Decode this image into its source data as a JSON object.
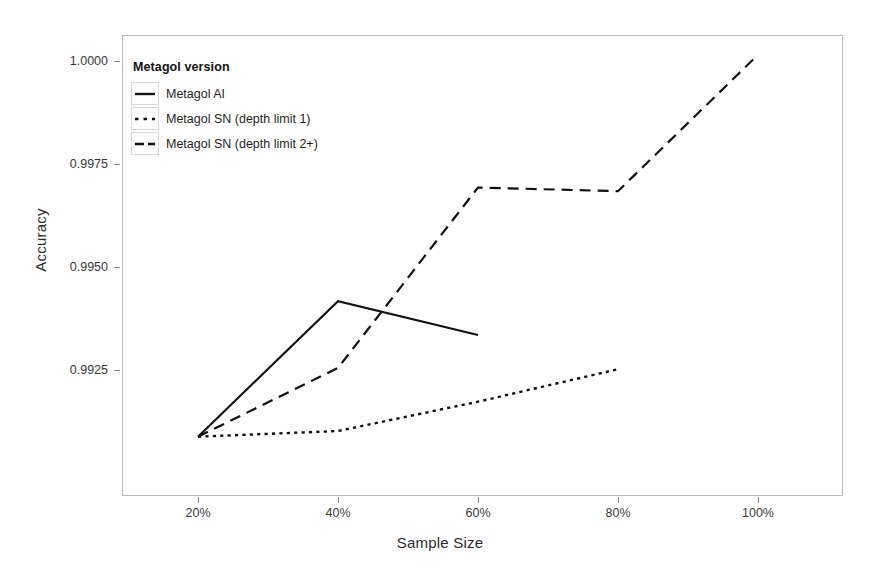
{
  "chart_data": {
    "type": "line",
    "title": "",
    "xlabel": "Sample Size",
    "ylabel": "Accuracy",
    "x": [
      "20%",
      "40%",
      "60%",
      "80%",
      "100%"
    ],
    "xtick_labels": [
      "20%",
      "40%",
      "60%",
      "80%",
      "100%"
    ],
    "ytick_labels": [
      "0.9925",
      "0.9950",
      "0.9975",
      "1.0000"
    ],
    "ylim": [
      0.99055,
      1.00035
    ],
    "grid": false,
    "legend_position": "top-left inside panel",
    "legend_title": "Metagol version",
    "series": [
      {
        "name": "Metagol AI",
        "style": "solid",
        "color": "#111111",
        "x": [
          "20%",
          "40%",
          "60%"
        ],
        "values": [
          0.99088,
          0.99417,
          0.99335
        ]
      },
      {
        "name": "Metagol SN (depth limit 1)",
        "style": "dotted",
        "color": "#111111",
        "x": [
          "20%",
          "40%",
          "60%",
          "80%"
        ],
        "values": [
          0.99088,
          0.99102,
          0.99173,
          0.99252
        ]
      },
      {
        "name": "Metagol SN (depth limit 2+)",
        "style": "dashed",
        "color": "#111111",
        "x": [
          "20%",
          "40%",
          "60%",
          "80%",
          "100%"
        ],
        "values": [
          0.99088,
          0.99255,
          0.99693,
          0.99684,
          1.00015
        ]
      }
    ]
  },
  "axes": {
    "y_title": "Accuracy",
    "x_title": "Sample Size",
    "y_ticks": [
      {
        "label": "0.9925"
      },
      {
        "label": "0.9950"
      },
      {
        "label": "0.9975"
      },
      {
        "label": "1.0000"
      }
    ],
    "x_ticks": [
      {
        "label": "20%"
      },
      {
        "label": "40%"
      },
      {
        "label": "60%"
      },
      {
        "label": "80%"
      },
      {
        "label": "100%"
      }
    ]
  },
  "legend": {
    "title": "Metagol version",
    "items": [
      {
        "label": "Metagol AI",
        "style": "solid"
      },
      {
        "label": "Metagol SN (depth limit 1)",
        "style": "dotted"
      },
      {
        "label": "Metagol SN (depth limit 2+)",
        "style": "dashed"
      }
    ]
  },
  "colors": {
    "line": "#111111",
    "panel_border": "#b9b9b9",
    "tick": "#8a8a8a",
    "background": "#ffffff"
  }
}
